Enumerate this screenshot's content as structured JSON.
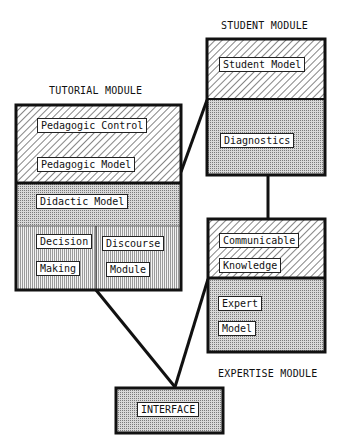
{
  "diagram": {
    "modules": {
      "tutorial": {
        "title": "TUTORIAL MODULE",
        "components": {
          "pedagogic_control": "Pedagogic Control",
          "pedagogic_model": "Pedagogic Model",
          "didactic_model": "Didactic Model",
          "decision_1": "Decision",
          "decision_2": "Making",
          "discourse_1": "Discourse",
          "discourse_2": "Module"
        }
      },
      "student": {
        "title": "STUDENT MODULE",
        "components": {
          "student_model": "Student Model",
          "diagnostics": "Diagnostics"
        }
      },
      "expertise": {
        "title": "EXPERTISE MODULE",
        "components": {
          "communicable_1": "Communicable",
          "communicable_2": "Knowledge",
          "expert_1": "Expert",
          "expert_2": "Model"
        }
      },
      "interface": {
        "label": "INTERFACE"
      }
    },
    "connections": [
      {
        "from": "tutorial",
        "to": "student"
      },
      {
        "from": "student",
        "to": "expertise"
      },
      {
        "from": "tutorial",
        "to": "interface"
      },
      {
        "from": "expertise",
        "to": "interface"
      }
    ]
  }
}
